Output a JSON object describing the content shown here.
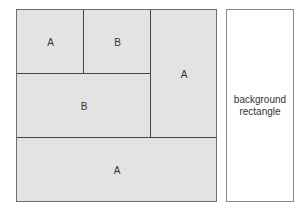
{
  "diagram": {
    "regions": [
      {
        "id": "top-left",
        "label": "A"
      },
      {
        "id": "top-middle",
        "label": "B"
      },
      {
        "id": "right-column",
        "label": "A"
      },
      {
        "id": "middle-left",
        "label": "B"
      },
      {
        "id": "bottom",
        "label": "A"
      }
    ],
    "background_label_line1": "background",
    "background_label_line2": "rectangle"
  }
}
